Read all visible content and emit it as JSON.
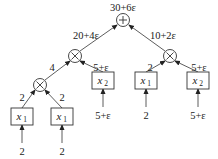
{
  "diagram": {
    "root": {
      "op": "+",
      "value": "30+6ε"
    },
    "edges": {
      "left_mult_to_root": "20+4ε",
      "right_mult_to_root": "10+2ε",
      "bottom_mult_to_left_mult": "4",
      "x2_a_to_left_mult": "5+ε",
      "x1_c_to_right_mult": "2",
      "x2_b_to_right_mult": "5+ε",
      "x1_a_to_bottom_mult": "2",
      "x1_b_to_bottom_mult": "2"
    },
    "inputs": [
      {
        "id": "x1_a",
        "var": "x",
        "sub": "1",
        "input": "2"
      },
      {
        "id": "x1_b",
        "var": "x",
        "sub": "1",
        "input": "2"
      },
      {
        "id": "x2_a",
        "var": "x",
        "sub": "2",
        "input": "5+ε"
      },
      {
        "id": "x1_c",
        "var": "x",
        "sub": "1",
        "input": "2"
      },
      {
        "id": "x2_b",
        "var": "x",
        "sub": "2",
        "input": "5+ε"
      }
    ],
    "operators": {
      "root": "plus",
      "left_mult": "times",
      "right_mult": "times",
      "bottom_mult": "times"
    }
  }
}
